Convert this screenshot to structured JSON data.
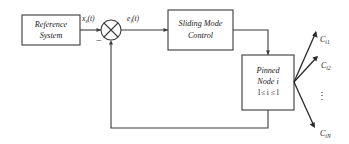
{
  "diagram": {
    "type": "control-block-diagram",
    "background_color": "#ffffff",
    "line_color": "#3a3a3a",
    "text_color": "#1a1a1a",
    "blocks": {
      "reference": {
        "line1": "Reference",
        "line2": "System"
      },
      "controller": {
        "line1": "Sliding Mode",
        "line2": "Control"
      },
      "plant": {
        "line1": "Pinned",
        "line2_prefix": "Node",
        "line2_index": "i",
        "range": "1≤ i ≤ l"
      }
    },
    "signals": {
      "reference_output": {
        "base": "x",
        "sub": "s",
        "arg": "(t)"
      },
      "error": {
        "base": "e",
        "sub": "i",
        "arg": "(t)"
      },
      "summing_sign": "−"
    },
    "outputs": {
      "ellipsis": "⋮",
      "items": [
        {
          "base": "C",
          "sub": "i1"
        },
        {
          "base": "C",
          "sub": "i2"
        },
        {
          "base": "C",
          "sub": "iN"
        }
      ]
    }
  }
}
